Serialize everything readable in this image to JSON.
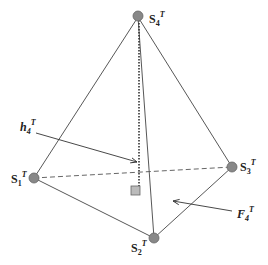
{
  "diagram": {
    "type": "tetrahedron",
    "vertices": [
      {
        "id": "S1",
        "label": "S",
        "subscript": "1",
        "superscript": "T"
      },
      {
        "id": "S2",
        "label": "S",
        "subscript": "2",
        "superscript": "T"
      },
      {
        "id": "S3",
        "label": "S",
        "subscript": "3",
        "superscript": "T"
      },
      {
        "id": "S4",
        "label": "S",
        "subscript": "4",
        "superscript": "T"
      }
    ],
    "edges": [
      {
        "from": "S4",
        "to": "S1",
        "style": "solid"
      },
      {
        "from": "S4",
        "to": "S2",
        "style": "solid"
      },
      {
        "from": "S4",
        "to": "S3",
        "style": "solid"
      },
      {
        "from": "S1",
        "to": "S2",
        "style": "solid"
      },
      {
        "from": "S2",
        "to": "S3",
        "style": "solid"
      },
      {
        "from": "S1",
        "to": "S3",
        "style": "dashed"
      }
    ],
    "height_annotation": {
      "label": "h",
      "subscript": "4",
      "superscript": "T",
      "style": "dotted"
    },
    "face_annotation": {
      "label": "F",
      "subscript": "4",
      "superscript": "T"
    },
    "colors": {
      "vertex_fill": "#888888",
      "line": "#333333",
      "foot_marker": "#bbbbbb"
    }
  }
}
